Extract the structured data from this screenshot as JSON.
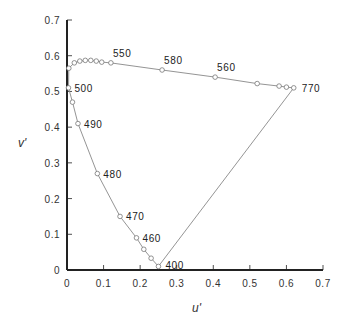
{
  "chart_data": {
    "type": "line",
    "title": "",
    "xlabel": "u'",
    "ylabel": "v'",
    "xlim": [
      0,
      0.7
    ],
    "ylim": [
      0,
      0.7
    ],
    "grid": false,
    "legend": null,
    "x_ticks": [
      "0",
      "0.1",
      "0.2",
      "0.3",
      "0.4",
      "0.5",
      "0.6",
      "0.7"
    ],
    "y_ticks": [
      "0",
      "0.1",
      "0.2",
      "0.3",
      "0.4",
      "0.5",
      "0.6",
      "0.7"
    ],
    "series": [
      {
        "name": "spectral locus",
        "closed": true,
        "points": [
          {
            "u": 0.25,
            "v": 0.01,
            "label": "400"
          },
          {
            "u": 0.23,
            "v": 0.033,
            "label": ""
          },
          {
            "u": 0.21,
            "v": 0.058,
            "label": ""
          },
          {
            "u": 0.19,
            "v": 0.09,
            "label": "460"
          },
          {
            "u": 0.145,
            "v": 0.15,
            "label": "470"
          },
          {
            "u": 0.083,
            "v": 0.27,
            "label": "480"
          },
          {
            "u": 0.03,
            "v": 0.41,
            "label": "490"
          },
          {
            "u": 0.015,
            "v": 0.47,
            "label": ""
          },
          {
            "u": 0.004,
            "v": 0.51,
            "label": "500"
          },
          {
            "u": 0.005,
            "v": 0.565,
            "label": ""
          },
          {
            "u": 0.02,
            "v": 0.58,
            "label": ""
          },
          {
            "u": 0.035,
            "v": 0.585,
            "label": ""
          },
          {
            "u": 0.05,
            "v": 0.587,
            "label": ""
          },
          {
            "u": 0.065,
            "v": 0.587,
            "label": ""
          },
          {
            "u": 0.08,
            "v": 0.585,
            "label": ""
          },
          {
            "u": 0.095,
            "v": 0.582,
            "label": ""
          },
          {
            "u": 0.12,
            "v": 0.58,
            "label": "550"
          },
          {
            "u": 0.26,
            "v": 0.56,
            "label": "580"
          },
          {
            "u": 0.405,
            "v": 0.54,
            "label": "560"
          },
          {
            "u": 0.52,
            "v": 0.522,
            "label": ""
          },
          {
            "u": 0.58,
            "v": 0.515,
            "label": ""
          },
          {
            "u": 0.6,
            "v": 0.512,
            "label": ""
          },
          {
            "u": 0.62,
            "v": 0.51,
            "label": "770"
          }
        ]
      }
    ]
  },
  "colors": {
    "axis": "#222222",
    "locus_line": "#888888",
    "marker": "#777777",
    "text": "#333333"
  }
}
